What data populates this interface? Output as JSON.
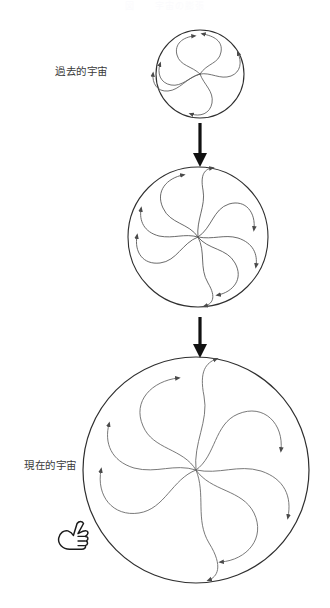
{
  "page": {
    "width": 330,
    "height": 608,
    "background": "#ffffff",
    "faint_title": "図　　宇宙の膨張",
    "stroke_color": "#3a3a3a",
    "circle_stroke": "#2f2f2f",
    "spiral_stroke": "#5a5a5a",
    "arrow_color": "#111111",
    "cursor_color": "#1a1a1a"
  },
  "labels": {
    "past": "過去的宇宙",
    "present": "現在的宇宙"
  },
  "diagram": {
    "type": "expanding-universe-sequence",
    "arm_count": 5,
    "stages": [
      {
        "name": "past-universe",
        "order": 1,
        "cx": 200,
        "cy": 74,
        "r": 44,
        "label": "過去的宇宙"
      },
      {
        "name": "intermediate-universe",
        "order": 2,
        "cx": 198,
        "cy": 237,
        "r": 70,
        "label": ""
      },
      {
        "name": "present-universe",
        "order": 3,
        "cx": 196,
        "cy": 470,
        "r": 113,
        "label": "現在的宇宙"
      }
    ],
    "arrows": [
      {
        "name": "arrow-stage1-to-stage2",
        "x": 200,
        "y1": 122,
        "y2": 165
      },
      {
        "name": "arrow-stage2-to-stage3",
        "x": 200,
        "y1": 316,
        "y2": 356
      }
    ],
    "cursor": {
      "name": "hand-pointer-cursor",
      "x": 58,
      "y": 524,
      "glyph": "pointing-hand"
    }
  }
}
